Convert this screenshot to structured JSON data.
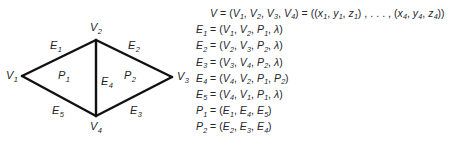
{
  "figure": {
    "type": "winged-edge-mesh-diagram",
    "stroke_color": "#111111",
    "text_color": "#24262b",
    "background": "#ffffff"
  },
  "diagram": {
    "vertices": [
      {
        "id": "V1",
        "label": "V",
        "sub": "1",
        "x": 22,
        "y": 76,
        "label_x": 6,
        "label_y": 70
      },
      {
        "id": "V2",
        "label": "V",
        "sub": "2",
        "x": 96,
        "y": 40,
        "label_x": 90,
        "label_y": 22
      },
      {
        "id": "V3",
        "label": "V",
        "sub": "3",
        "x": 172,
        "y": 77,
        "label_x": 177,
        "label_y": 71
      },
      {
        "id": "V4",
        "label": "V",
        "sub": "4",
        "x": 96,
        "y": 116,
        "label_x": 90,
        "label_y": 121
      }
    ],
    "edges": [
      {
        "id": "E1",
        "label": "E",
        "sub": "1",
        "from": "V1",
        "to": "V2",
        "label_x": 50,
        "label_y": 40
      },
      {
        "id": "E2",
        "label": "E",
        "sub": "2",
        "from": "V2",
        "to": "V3",
        "label_x": 128,
        "label_y": 40
      },
      {
        "id": "E3",
        "label": "E",
        "sub": "3",
        "from": "V3",
        "to": "V4",
        "label_x": 130,
        "label_y": 105
      },
      {
        "id": "E4",
        "label": "E",
        "sub": "4",
        "from": "V4",
        "to": "V2",
        "label_x": 101,
        "label_y": 76
      },
      {
        "id": "E5",
        "label": "E",
        "sub": "5",
        "from": "V4",
        "to": "V1",
        "label_x": 52,
        "label_y": 105
      }
    ],
    "polygons": [
      {
        "id": "P1",
        "label": "P",
        "sub": "1",
        "label_x": 58,
        "label_y": 70
      },
      {
        "id": "P2",
        "label": "P",
        "sub": "2",
        "label_x": 124,
        "label_y": 70
      }
    ]
  },
  "equations": [
    {
      "id": "vertex-set",
      "indent": true,
      "parts": [
        {
          "t": "V",
          "k": "var"
        },
        {
          "t": " = (",
          "k": "op"
        },
        {
          "t": "V",
          "k": "var",
          "sub": "1"
        },
        {
          "t": ", ",
          "k": "op"
        },
        {
          "t": "V",
          "k": "var",
          "sub": "2"
        },
        {
          "t": ", ",
          "k": "op"
        },
        {
          "t": "V",
          "k": "var",
          "sub": "3"
        },
        {
          "t": ", ",
          "k": "op"
        },
        {
          "t": "V",
          "k": "var",
          "sub": "4"
        },
        {
          "t": ") = ((",
          "k": "op"
        },
        {
          "t": "x",
          "k": "var",
          "sub": "1"
        },
        {
          "t": ", ",
          "k": "op"
        },
        {
          "t": "y",
          "k": "var",
          "sub": "1"
        },
        {
          "t": ", ",
          "k": "op"
        },
        {
          "t": "z",
          "k": "var",
          "sub": "1"
        },
        {
          "t": ") , . . . , (",
          "k": "op"
        },
        {
          "t": "x",
          "k": "var",
          "sub": "4"
        },
        {
          "t": ", ",
          "k": "op"
        },
        {
          "t": "y",
          "k": "var",
          "sub": "4"
        },
        {
          "t": ", ",
          "k": "op"
        },
        {
          "t": "z",
          "k": "var",
          "sub": "4"
        },
        {
          "t": "))",
          "k": "op"
        }
      ]
    },
    {
      "id": "edge-1",
      "indent": false,
      "parts": [
        {
          "t": "E",
          "k": "var",
          "sub": "1"
        },
        {
          "t": " = (",
          "k": "op"
        },
        {
          "t": "V",
          "k": "var",
          "sub": "1"
        },
        {
          "t": ", ",
          "k": "op"
        },
        {
          "t": "V",
          "k": "var",
          "sub": "2"
        },
        {
          "t": ", ",
          "k": "op"
        },
        {
          "t": "P",
          "k": "var",
          "sub": "1"
        },
        {
          "t": ", ",
          "k": "op"
        },
        {
          "t": "λ",
          "k": "var"
        },
        {
          "t": ")",
          "k": "op"
        }
      ]
    },
    {
      "id": "edge-2",
      "indent": false,
      "parts": [
        {
          "t": "E",
          "k": "var",
          "sub": "2"
        },
        {
          "t": " = (",
          "k": "op"
        },
        {
          "t": "V",
          "k": "var",
          "sub": "2"
        },
        {
          "t": ", ",
          "k": "op"
        },
        {
          "t": "V",
          "k": "var",
          "sub": "3"
        },
        {
          "t": ", ",
          "k": "op"
        },
        {
          "t": "P",
          "k": "var",
          "sub": "2"
        },
        {
          "t": ", ",
          "k": "op"
        },
        {
          "t": "λ",
          "k": "var"
        },
        {
          "t": ")",
          "k": "op"
        }
      ]
    },
    {
      "id": "edge-3",
      "indent": false,
      "parts": [
        {
          "t": "E",
          "k": "var",
          "sub": "3"
        },
        {
          "t": " = (",
          "k": "op"
        },
        {
          "t": "V",
          "k": "var",
          "sub": "3"
        },
        {
          "t": ", ",
          "k": "op"
        },
        {
          "t": "V",
          "k": "var",
          "sub": "4"
        },
        {
          "t": ", ",
          "k": "op"
        },
        {
          "t": "P",
          "k": "var",
          "sub": "2"
        },
        {
          "t": ", ",
          "k": "op"
        },
        {
          "t": "λ",
          "k": "var"
        },
        {
          "t": ")",
          "k": "op"
        }
      ]
    },
    {
      "id": "edge-4",
      "indent": false,
      "parts": [
        {
          "t": "E",
          "k": "var",
          "sub": "4"
        },
        {
          "t": " = (",
          "k": "op"
        },
        {
          "t": "V",
          "k": "var",
          "sub": "4"
        },
        {
          "t": ", ",
          "k": "op"
        },
        {
          "t": "V",
          "k": "var",
          "sub": "2"
        },
        {
          "t": ", ",
          "k": "op"
        },
        {
          "t": "P",
          "k": "var",
          "sub": "1"
        },
        {
          "t": ", ",
          "k": "op"
        },
        {
          "t": "P",
          "k": "var",
          "sub": "2"
        },
        {
          "t": ")",
          "k": "op"
        }
      ]
    },
    {
      "id": "edge-5",
      "indent": false,
      "parts": [
        {
          "t": "E",
          "k": "var",
          "sub": "5"
        },
        {
          "t": " = (",
          "k": "op"
        },
        {
          "t": "V",
          "k": "var",
          "sub": "4"
        },
        {
          "t": ", ",
          "k": "op"
        },
        {
          "t": "V",
          "k": "var",
          "sub": "1"
        },
        {
          "t": ", ",
          "k": "op"
        },
        {
          "t": "P",
          "k": "var",
          "sub": "1"
        },
        {
          "t": ", ",
          "k": "op"
        },
        {
          "t": "λ",
          "k": "var"
        },
        {
          "t": ")",
          "k": "op"
        }
      ]
    },
    {
      "id": "polygon-1",
      "indent": false,
      "parts": [
        {
          "t": "P",
          "k": "var",
          "sub": "1"
        },
        {
          "t": " = (",
          "k": "op"
        },
        {
          "t": "E",
          "k": "var",
          "sub": "1"
        },
        {
          "t": ", ",
          "k": "op"
        },
        {
          "t": "E",
          "k": "var",
          "sub": "4"
        },
        {
          "t": ", ",
          "k": "op"
        },
        {
          "t": "E",
          "k": "var",
          "sub": "5"
        },
        {
          "t": ")",
          "k": "op"
        }
      ]
    },
    {
      "id": "polygon-2",
      "indent": false,
      "parts": [
        {
          "t": "P",
          "k": "var",
          "sub": "2"
        },
        {
          "t": " = (",
          "k": "op"
        },
        {
          "t": "E",
          "k": "var",
          "sub": "2"
        },
        {
          "t": ", ",
          "k": "op"
        },
        {
          "t": "E",
          "k": "var",
          "sub": "3"
        },
        {
          "t": ", ",
          "k": "op"
        },
        {
          "t": "E",
          "k": "var",
          "sub": "4"
        },
        {
          "t": ")",
          "k": "op"
        }
      ]
    }
  ]
}
